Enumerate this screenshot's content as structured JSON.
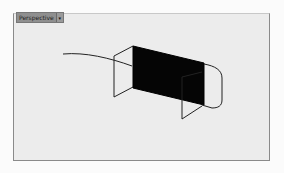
{
  "viewport": {
    "title": "Perspective",
    "dropdown_icon": "chevron-down-icon",
    "dropdown_glyph": "▾",
    "background": "#ececec",
    "frame_color": "#8a8a8a"
  },
  "scene": {
    "objects": [
      {
        "name": "curve",
        "type": "polyline"
      },
      {
        "name": "front-frame",
        "type": "wireframe"
      },
      {
        "name": "filled-panel",
        "type": "solid",
        "color": "#000000"
      },
      {
        "name": "back-frame",
        "type": "wireframe"
      },
      {
        "name": "rounded-loop",
        "type": "curve"
      }
    ]
  }
}
